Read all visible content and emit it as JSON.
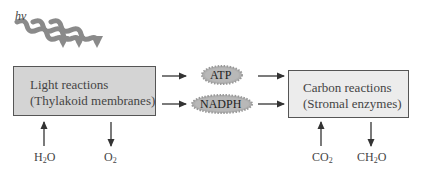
{
  "diagram": {
    "light_input": {
      "symbol": "hν"
    },
    "light_reactions": {
      "title": "Light reactions",
      "location": "(Thylakoid membranes)"
    },
    "carbon_reactions": {
      "title": "Carbon reactions",
      "location": "(Stromal enzymes)"
    },
    "intermediates": [
      {
        "label": "ATP"
      },
      {
        "label": "NADPH"
      }
    ],
    "inputs_outputs": {
      "light_in": {
        "base": "H",
        "sub": "2",
        "tail": "O"
      },
      "light_out": {
        "base": "O",
        "sub": "2",
        "tail": ""
      },
      "carbon_in": {
        "base": "CO",
        "sub": "2",
        "tail": ""
      },
      "carbon_out": {
        "base": "CH",
        "sub": "2",
        "tail": "O"
      }
    },
    "colors": {
      "light_box_fill": "#d4d4d4",
      "carbon_box_fill": "#ececec",
      "badge_fill": "#b0b0b0",
      "arrow": "#333333",
      "wave": "#8a8a8a"
    }
  }
}
